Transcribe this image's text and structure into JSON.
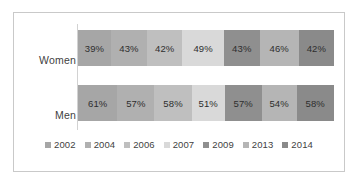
{
  "chart_data": {
    "type": "bar",
    "title": "",
    "subtitle": "",
    "xlabel": "",
    "ylabel": "",
    "orientation": "horizontal",
    "stacked": true,
    "normalized_percent": true,
    "grid": false,
    "legend_position": "bottom",
    "xlim": [
      0,
      100
    ],
    "categories": [
      "Women",
      "Men"
    ],
    "series": [
      {
        "name": "2002",
        "values": [
          39,
          61
        ],
        "labels": [
          "39%",
          "61%"
        ],
        "color": "#a6a6a6"
      },
      {
        "name": "2004",
        "values": [
          43,
          57
        ],
        "labels": [
          "43%",
          "57%"
        ],
        "color": "#b0b0b0"
      },
      {
        "name": "2006",
        "values": [
          42,
          58
        ],
        "labels": [
          "42%",
          "58%"
        ],
        "color": "#bfbfbf"
      },
      {
        "name": "2007",
        "values": [
          49,
          51
        ],
        "labels": [
          "49%",
          "51%"
        ],
        "color": "#d9d9d9"
      },
      {
        "name": "2009",
        "values": [
          43,
          57
        ],
        "labels": [
          "43%",
          "57%"
        ],
        "color": "#8f8f8f"
      },
      {
        "name": "2013",
        "values": [
          46,
          54
        ],
        "labels": [
          "46%",
          "54%"
        ],
        "color": "#b5b5b5"
      },
      {
        "name": "2014",
        "values": [
          42,
          58
        ],
        "labels": [
          "42%",
          "58%"
        ],
        "color": "#8a8a8a"
      }
    ]
  },
  "axis": {
    "category_labels": [
      {
        "text": "Women"
      },
      {
        "text": "Men"
      }
    ]
  },
  "rows": [
    {
      "name": "Women",
      "cells": [
        {
          "label": "39%",
          "color": "#a6a6a6"
        },
        {
          "label": "43%",
          "color": "#b0b0b0"
        },
        {
          "label": "42%",
          "color": "#bfbfbf"
        },
        {
          "label": "49%",
          "color": "#d9d9d9"
        },
        {
          "label": "43%",
          "color": "#8f8f8f"
        },
        {
          "label": "46%",
          "color": "#b5b5b5"
        },
        {
          "label": "42%",
          "color": "#8a8a8a"
        }
      ]
    },
    {
      "name": "Men",
      "cells": [
        {
          "label": "61%",
          "color": "#a6a6a6"
        },
        {
          "label": "57%",
          "color": "#b0b0b0"
        },
        {
          "label": "58%",
          "color": "#bfbfbf"
        },
        {
          "label": "51%",
          "color": "#d9d9d9"
        },
        {
          "label": "57%",
          "color": "#8f8f8f"
        },
        {
          "label": "54%",
          "color": "#b5b5b5"
        },
        {
          "label": "58%",
          "color": "#8a8a8a"
        }
      ]
    }
  ],
  "legend": {
    "items": [
      {
        "label": "2002",
        "color": "#a6a6a6"
      },
      {
        "label": "2004",
        "color": "#b0b0b0"
      },
      {
        "label": "2006",
        "color": "#bfbfbf"
      },
      {
        "label": "2007",
        "color": "#d9d9d9"
      },
      {
        "label": "2009",
        "color": "#8f8f8f"
      },
      {
        "label": "2013",
        "color": "#b5b5b5"
      },
      {
        "label": "2014",
        "color": "#8a8a8a"
      }
    ]
  },
  "style": {
    "frame_border": "#c9c9c9",
    "axis_line": "#d2d2d2",
    "background": "#ffffff",
    "text": "#3f3f3f"
  }
}
